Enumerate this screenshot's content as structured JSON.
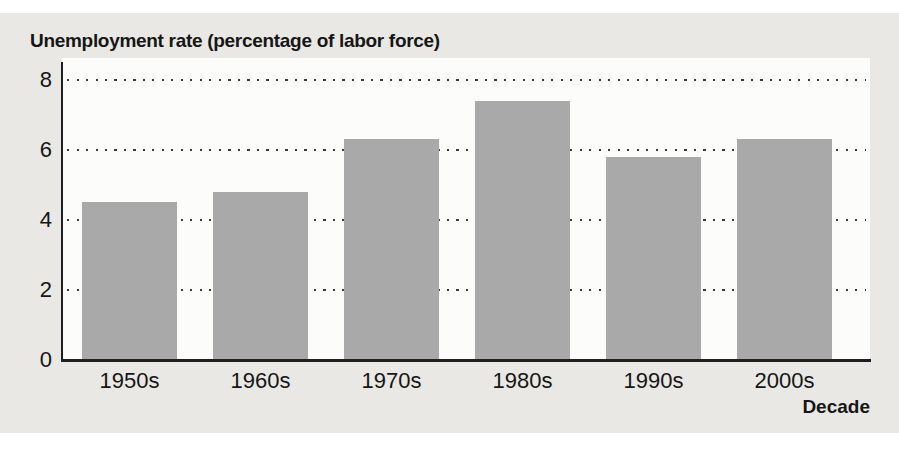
{
  "chart_data": {
    "type": "bar",
    "title": "Unemployment rate (percentage of labor force)",
    "xlabel": "Decade",
    "ylabel": "Unemployment rate (percentage of labor force)",
    "categories": [
      "1950s",
      "1960s",
      "1970s",
      "1980s",
      "1990s",
      "2000s"
    ],
    "values": [
      4.5,
      4.8,
      6.3,
      7.4,
      5.8,
      6.3
    ],
    "ylim": [
      0,
      8
    ],
    "yticks": [
      0,
      2,
      4,
      6,
      8
    ],
    "grid": "horizontal dotted lines at y = 2, 4, 6, 8",
    "legend": "none",
    "bar_color": "#a9a9a9"
  },
  "colors": {
    "page_background": "#ffffff",
    "panel_background": "#e9e8e4",
    "plot_background": "#fcfcfb",
    "bar": "#a9a9a9",
    "axis": "#1f1f1f",
    "grid_dots": "#3c3c3c",
    "text": "#161616"
  }
}
